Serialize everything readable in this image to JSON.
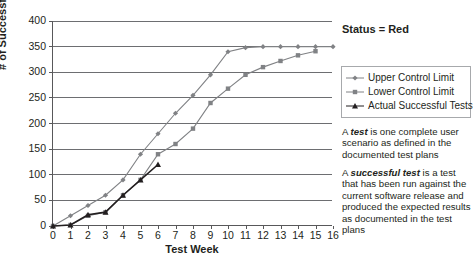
{
  "chart_data": {
    "type": "line",
    "title": "",
    "xlabel": "Test Week",
    "ylabel": "# of Successful Tests",
    "xlim": [
      0,
      16
    ],
    "ylim": [
      0,
      400
    ],
    "ytick_step": 50,
    "grid": "horizontal",
    "legend_position": "right",
    "x": [
      0,
      1,
      2,
      3,
      4,
      5,
      6,
      7,
      8,
      9,
      10,
      11,
      12,
      13,
      14,
      15,
      16
    ],
    "yticks": [
      0,
      50,
      100,
      150,
      200,
      250,
      300,
      350,
      400
    ],
    "xticks": [
      0,
      1,
      2,
      3,
      4,
      5,
      6,
      7,
      8,
      9,
      10,
      11,
      12,
      13,
      14,
      15,
      16
    ],
    "series": [
      {
        "name": "Upper Control Limit",
        "marker": "diamond",
        "color": "#808285",
        "values": [
          0,
          20,
          40,
          60,
          90,
          140,
          180,
          220,
          255,
          295,
          340,
          348,
          350,
          350,
          350,
          350,
          350
        ]
      },
      {
        "name": "Lower Control Limit",
        "marker": "square",
        "color": "#808285",
        "values": [
          0,
          2,
          20,
          27,
          60,
          90,
          140,
          160,
          190,
          240,
          268,
          295,
          310,
          322,
          333,
          341,
          null
        ]
      },
      {
        "name": "Actual Successful Tests",
        "marker": "triangle",
        "color": "#231f20",
        "values": [
          0,
          2,
          22,
          27,
          60,
          90,
          120,
          null,
          null,
          null,
          null,
          null,
          null,
          null,
          null,
          null,
          null
        ]
      }
    ]
  },
  "side": {
    "status": "Status = Red",
    "legend": [
      {
        "label": "Upper Control Limit",
        "marker": "diamond"
      },
      {
        "label": "Lower Control Limit",
        "marker": "square"
      },
      {
        "label": "Actual Successful Tests",
        "marker": "triangle"
      }
    ],
    "definitions": [
      {
        "lead": "A ",
        "term": "test",
        "rest": " is one complete user scenario as defined in the documented test plans"
      },
      {
        "lead": "A ",
        "term": "successful test",
        "rest": " is a test that has been run against the current software release and produced the expected results as documented in the test plans"
      }
    ]
  },
  "colors": {
    "axis": "#58585a",
    "grid": "#6d6e71",
    "text": "#231f20",
    "series_gray": "#808285",
    "series_dark": "#231f20",
    "legend_border": "#a7a9ac"
  }
}
